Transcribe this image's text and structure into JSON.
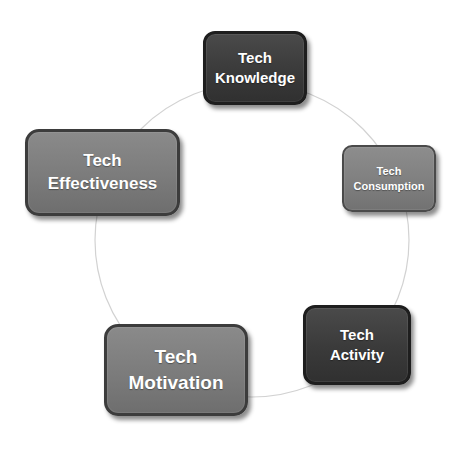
{
  "diagram": {
    "type": "cycle",
    "connector_color": "#c8c8c8",
    "nodes": [
      {
        "id": "knowledge",
        "line1": "Tech",
        "line2": "Knowledge",
        "fill": "#3d3d3d"
      },
      {
        "id": "consumption",
        "line1": "Tech",
        "line2": "Consumption",
        "fill": "#7e7e7e"
      },
      {
        "id": "activity",
        "line1": "Tech",
        "line2": "Activity",
        "fill": "#3a3a3a"
      },
      {
        "id": "motivation",
        "line1": "Tech",
        "line2": "Motivation",
        "fill": "#7c7c7c"
      },
      {
        "id": "effectiveness",
        "line1": "Tech",
        "line2": "Effectiveness",
        "fill": "#7c7c7c"
      }
    ]
  }
}
